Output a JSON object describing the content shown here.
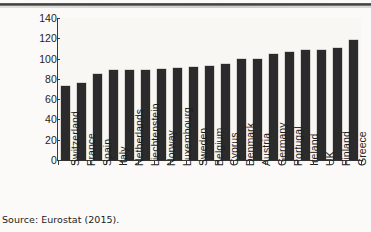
{
  "figure": {
    "source_caption": "Source: Eurostat (2015)."
  },
  "chart_data": {
    "type": "bar",
    "title": "",
    "subtitle": "",
    "xlabel": "",
    "ylabel": "",
    "ylim": [
      0,
      140
    ],
    "yticks": [
      0,
      20,
      40,
      60,
      80,
      100,
      120,
      140
    ],
    "ytick_labels": [
      "0",
      "20",
      "40",
      "60",
      "80",
      "100",
      "120",
      "140"
    ],
    "grid": false,
    "legend": null,
    "orientation": "vertical",
    "bar_color": "#2b2b2b",
    "plot_background": "#f8f7f4",
    "categories": [
      "Switzerland",
      "France",
      "Spain",
      "Italy",
      "Netherlands",
      "Liechtenstein",
      "Norway",
      "Luxembourg",
      "Sweden",
      "Belgium",
      "Cyprus",
      "Denmark",
      "Austria",
      "Germany",
      "Portugal",
      "Ireland",
      "UK",
      "Finland",
      "Greece"
    ],
    "values": [
      73,
      76,
      85,
      88.5,
      89,
      89,
      90,
      91,
      92,
      93,
      95,
      99.5,
      100,
      105,
      106.5,
      108,
      108.5,
      110.5,
      118
    ],
    "series": [
      {
        "name": "",
        "values": [
          73,
          76,
          85,
          88.5,
          89,
          89,
          90,
          91,
          92,
          93,
          95,
          99.5,
          100,
          105,
          106.5,
          108,
          108.5,
          110.5,
          118
        ]
      }
    ]
  }
}
